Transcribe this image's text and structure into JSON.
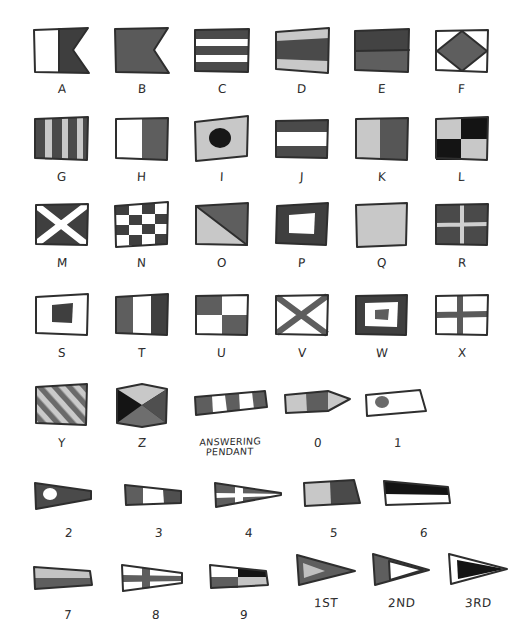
{
  "document": {
    "title": "International Maritime Signal Flags",
    "style": "hand-drawn grayscale illustration",
    "background_color": "#ffffff",
    "ink_color": "#2e2e2e",
    "palette": {
      "dark": "#3a3a3a",
      "mid": "#5f5f5f",
      "light": "#c9c9c9",
      "black": "#141414",
      "white": "#ffffff"
    }
  },
  "rows": [
    {
      "row_name": "letters-a-f",
      "items": [
        {
          "label": "A",
          "name": "flag-a",
          "shape": "swallowtail",
          "pattern": "vertical-half white/dark"
        },
        {
          "label": "B",
          "name": "flag-b",
          "shape": "swallowtail",
          "pattern": "solid mid"
        },
        {
          "label": "C",
          "name": "flag-c",
          "shape": "rectangle",
          "pattern": "five horizontal stripes dark/white"
        },
        {
          "label": "D",
          "name": "flag-d",
          "shape": "rectangle",
          "pattern": "three horizontal bands light/dark/light"
        },
        {
          "label": "E",
          "name": "flag-e",
          "shape": "rectangle",
          "pattern": "two horizontal bands dark/mid"
        },
        {
          "label": "F",
          "name": "flag-f",
          "shape": "rectangle",
          "pattern": "white with mid diamond"
        }
      ]
    },
    {
      "row_name": "letters-g-l",
      "items": [
        {
          "label": "G",
          "name": "flag-g",
          "shape": "rectangle",
          "pattern": "six vertical stripes dark/light"
        },
        {
          "label": "H",
          "name": "flag-h",
          "shape": "rectangle",
          "pattern": "vertical half white/mid"
        },
        {
          "label": "I",
          "name": "flag-i",
          "shape": "rectangle",
          "pattern": "light with black circle"
        },
        {
          "label": "J",
          "name": "flag-j",
          "shape": "rectangle",
          "pattern": "three horizontal bands dark/white/dark"
        },
        {
          "label": "K",
          "name": "flag-k",
          "shape": "rectangle",
          "pattern": "vertical half light/dark"
        },
        {
          "label": "L",
          "name": "flag-l",
          "shape": "rectangle",
          "pattern": "quartered light/black"
        }
      ]
    },
    {
      "row_name": "letters-m-r",
      "items": [
        {
          "label": "M",
          "name": "flag-m",
          "shape": "rectangle",
          "pattern": "dark with white saltire"
        },
        {
          "label": "N",
          "name": "flag-n",
          "shape": "rectangle",
          "pattern": "checkerboard dark/white 4x4"
        },
        {
          "label": "O",
          "name": "flag-o",
          "shape": "rectangle",
          "pattern": "diagonal split mid/light"
        },
        {
          "label": "P",
          "name": "flag-p",
          "shape": "rectangle",
          "pattern": "dark border with white centre"
        },
        {
          "label": "Q",
          "name": "flag-q",
          "shape": "rectangle",
          "pattern": "solid light"
        },
        {
          "label": "R",
          "name": "flag-r",
          "shape": "rectangle",
          "pattern": "dark with light cross"
        }
      ]
    },
    {
      "row_name": "letters-s-x",
      "items": [
        {
          "label": "S",
          "name": "flag-s",
          "shape": "rectangle",
          "pattern": "white with dark centre square"
        },
        {
          "label": "T",
          "name": "flag-t",
          "shape": "rectangle",
          "pattern": "three vertical bands mid/white/dark"
        },
        {
          "label": "U",
          "name": "flag-u",
          "shape": "rectangle",
          "pattern": "quartered mid/white"
        },
        {
          "label": "V",
          "name": "flag-v",
          "shape": "rectangle",
          "pattern": "white with mid saltire"
        },
        {
          "label": "W",
          "name": "flag-w",
          "shape": "rectangle",
          "pattern": "dark border white ring mid centre"
        },
        {
          "label": "X",
          "name": "flag-x",
          "shape": "rectangle",
          "pattern": "white with mid cross"
        }
      ]
    },
    {
      "row_name": "letters-y-z-and-numerals-0-1",
      "items": [
        {
          "label": "Y",
          "name": "flag-y",
          "shape": "rectangle",
          "pattern": "diagonal stripes mid/light"
        },
        {
          "label": "Z",
          "name": "flag-z",
          "shape": "rectangle",
          "pattern": "four triangles black/light/mid"
        },
        {
          "label": "ANSWERING PENDANT",
          "name": "flag-answering-pendant",
          "shape": "pennant",
          "pattern": "vertical stripes mid/white"
        },
        {
          "label": "0",
          "name": "pennant-0",
          "shape": "pennant",
          "pattern": "three vertical bands light/mid/light"
        },
        {
          "label": "1",
          "name": "pennant-1",
          "shape": "pennant",
          "pattern": "white with mid disc"
        }
      ]
    },
    {
      "row_name": "numerals-2-6",
      "items": [
        {
          "label": "2",
          "name": "pennant-2",
          "shape": "pennant",
          "pattern": "dark with white disc"
        },
        {
          "label": "3",
          "name": "pennant-3",
          "shape": "pennant",
          "pattern": "mid/white/mid vertical bands"
        },
        {
          "label": "4",
          "name": "pennant-4",
          "shape": "pennant",
          "pattern": "mid with white cross"
        },
        {
          "label": "5",
          "name": "pennant-5",
          "shape": "pennant",
          "pattern": "light/dark vertical halves"
        },
        {
          "label": "6",
          "name": "pennant-6",
          "shape": "pennant",
          "pattern": "black over white horizontal"
        }
      ]
    },
    {
      "row_name": "numerals-7-9-and-repeaters",
      "items": [
        {
          "label": "7",
          "name": "pennant-7",
          "shape": "pennant",
          "pattern": "light over mid horizontal"
        },
        {
          "label": "8",
          "name": "pennant-8",
          "shape": "pennant",
          "pattern": "white with mid cross"
        },
        {
          "label": "9",
          "name": "pennant-9",
          "shape": "pennant",
          "pattern": "quartered white/black/mid/light"
        },
        {
          "label": "1ST",
          "name": "repeater-1st",
          "shape": "triangle",
          "pattern": "mid with light wedge"
        },
        {
          "label": "2ND",
          "name": "repeater-2nd",
          "shape": "triangle",
          "pattern": "mid with white triangle"
        },
        {
          "label": "3RD",
          "name": "repeater-3rd",
          "shape": "triangle",
          "pattern": "white with black triangle"
        }
      ]
    }
  ]
}
